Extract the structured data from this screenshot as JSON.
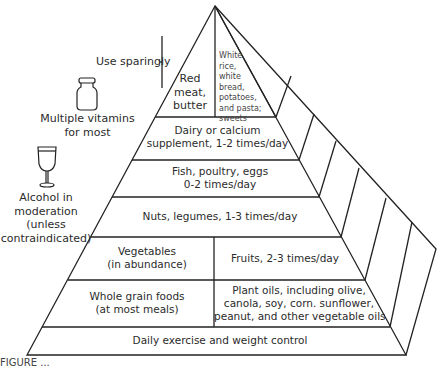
{
  "diagram": {
    "type": "food pyramid",
    "tiers": [
      {
        "id": "top",
        "left": "Red meat, butter",
        "left_lines": [
          "Red",
          "meat,",
          "butter"
        ],
        "right_lines": [
          "White",
          "rice,",
          "white",
          "bread,",
          "potatoes,",
          "and pasta;",
          "sweets"
        ]
      },
      {
        "id": "dairy",
        "lines": [
          "Dairy or calcium",
          "supplement, 1-2 times/day"
        ]
      },
      {
        "id": "fish",
        "lines": [
          "Fish, poultry, eggs",
          "0-2 times/day"
        ]
      },
      {
        "id": "nuts",
        "lines": [
          "Nuts, legumes, 1-3 times/day"
        ]
      },
      {
        "id": "veg-fruit",
        "left_lines": [
          "Vegetables",
          "(in abundance)"
        ],
        "right_lines": [
          "Fruits, 2-3 times/day"
        ]
      },
      {
        "id": "grains-oils",
        "left_lines": [
          "Whole grain foods",
          "(at most meals)"
        ],
        "right_lines": [
          "Plant oils, including olive,",
          "canola, soy, corn. sunflower,",
          "peanut, and other vegetable oils"
        ]
      },
      {
        "id": "base",
        "lines": [
          "Daily exercise and weight control"
        ]
      }
    ],
    "side_notes": {
      "use_sparingly": "Use sparingly",
      "vitamins": [
        "Multiple vitamins",
        "for most"
      ],
      "alcohol": [
        "Alcohol in",
        "moderation",
        "(unless",
        "contraindicated)"
      ]
    },
    "icons": {
      "vitamins": "vitamin-bottle-icon",
      "alcohol": "wine-glass-icon"
    },
    "caption_partial": "FIGURE ..."
  }
}
